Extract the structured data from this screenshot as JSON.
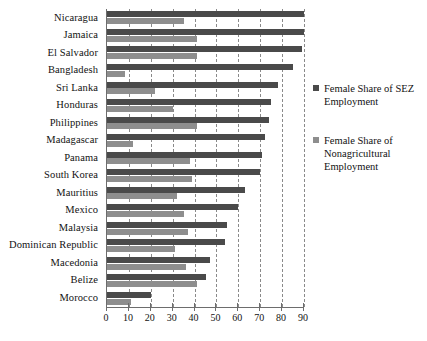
{
  "chart_data": {
    "type": "bar",
    "orientation": "horizontal",
    "title": "",
    "xlabel": "",
    "ylabel": "",
    "xlim": [
      0,
      90
    ],
    "xticks": [
      0,
      10,
      20,
      30,
      40,
      50,
      60,
      70,
      80,
      90
    ],
    "grid": "vertical-dashed",
    "legend_position": "right",
    "categories": [
      "Nicaragua",
      "Jamaica",
      "El Salvador",
      "Bangladesh",
      "Sri Lanka",
      "Honduras",
      "Philippines",
      "Madagascar",
      "Panama",
      "South Korea",
      "Mauritius",
      "Mexico",
      "Malaysia",
      "Dominican Republic",
      "Macedonia",
      "Belize",
      "Morocco"
    ],
    "series": [
      {
        "name": "Female Share of SEZ Employment",
        "color": "#4a4a4a",
        "values": [
          90,
          90,
          89,
          85,
          78,
          75,
          74,
          72,
          71,
          70,
          63,
          60,
          55,
          54,
          47,
          45,
          20
        ]
      },
      {
        "name": "Female Share of Nonagricultural Employment",
        "color": "#8e8e8e",
        "values": [
          35,
          41,
          41,
          8,
          22,
          30,
          41,
          12,
          38,
          39,
          32,
          35,
          37,
          31,
          36,
          41,
          11
        ]
      }
    ]
  },
  "legend": {
    "items": [
      {
        "label": "Female Share of SEZ Employment",
        "color": "#4a4a4a"
      },
      {
        "label": "Female Share of Nonagricultural Employment",
        "color": "#8e8e8e"
      }
    ]
  },
  "axis": {
    "x_tick_labels": [
      "0",
      "10",
      "20",
      "30",
      "40",
      "50",
      "60",
      "70",
      "80",
      "90"
    ]
  }
}
